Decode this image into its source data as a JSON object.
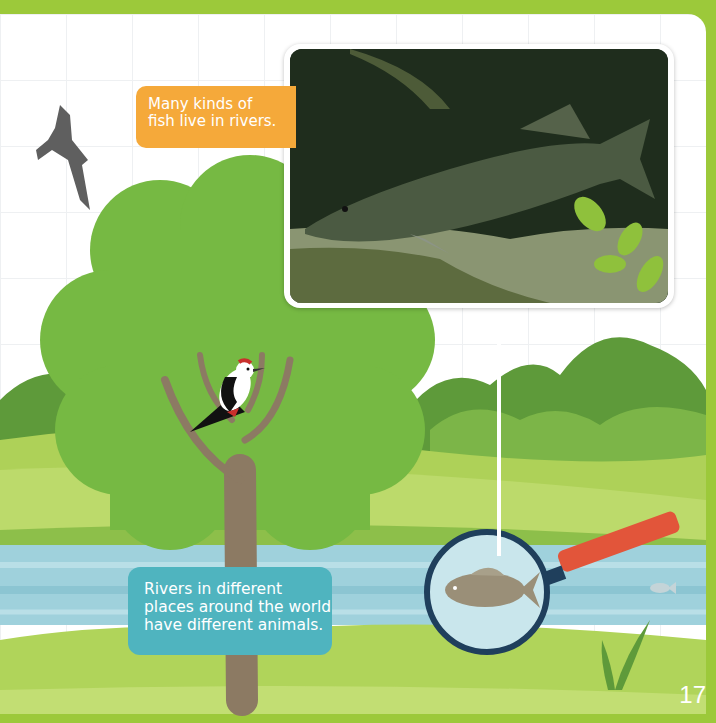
{
  "page": {
    "number": "17",
    "colors": {
      "border_green": "#9cc93a",
      "tree_green": "#76b943",
      "orange_caption": "#f5a93a",
      "teal_caption": "#4fb4bf",
      "river_blue": "#9fd1dc",
      "magnifier_handle": "#e2553a",
      "magnifier_rim": "#1f3f5c"
    }
  },
  "captions": {
    "fish_caption": {
      "lines": [
        "Many kinds of",
        "fish live in rivers."
      ]
    },
    "rivers_caption": {
      "lines": [
        "Rivers in different",
        "places around the world",
        "have different animals."
      ]
    }
  },
  "illustrations": {
    "photo": "pike-fish-photo",
    "bird_top_left": "eagle-silhouette",
    "bird_in_tree": "woodpecker",
    "magnified_fish": "carp",
    "small_fish": "small-fish",
    "leaves": "leaf-sprig"
  }
}
